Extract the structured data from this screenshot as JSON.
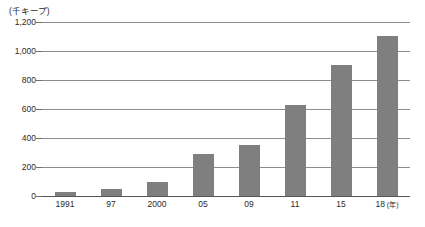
{
  "chart_data": {
    "type": "bar",
    "title": "",
    "subtitle": "",
    "unit_label": "(千キープ)",
    "xlabel": "(年)",
    "ylabel": "",
    "categories": [
      "1991",
      "97",
      "2000",
      "05",
      "09",
      "11",
      "15",
      "18"
    ],
    "values": [
      30,
      45,
      100,
      290,
      350,
      625,
      905,
      1105
    ],
    "series": [
      {
        "name": "",
        "values": [
          30,
          45,
          100,
          290,
          350,
          625,
          905,
          1105
        ]
      }
    ],
    "ylim": [
      0,
      1200
    ],
    "yticks": [
      0,
      200,
      400,
      600,
      800,
      1000,
      1200
    ],
    "ytick_labels": [
      "0",
      "200",
      "400",
      "600",
      "800",
      "1,000",
      "1,200"
    ],
    "grid": true,
    "legend": "none",
    "bar_color": "#7f7f7f",
    "grid_color": "#8d8d8d",
    "axis_color": "#555555",
    "text_color": "#2b2b2b"
  },
  "axis": {
    "unit_caption": "(千キープ)",
    "x_unit_suffix": "(年)"
  }
}
